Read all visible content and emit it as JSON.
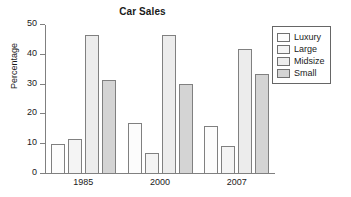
{
  "chart_data": {
    "type": "bar",
    "title": "Car Sales",
    "xlabel": "",
    "ylabel": "Percentage",
    "categories": [
      "1985",
      "2000",
      "2007"
    ],
    "series": [
      {
        "name": "Luxury",
        "values": [
          10.0,
          17.2,
          16.2
        ],
        "color": "#fcfcfc"
      },
      {
        "name": "Large",
        "values": [
          11.6,
          7.0,
          9.3
        ],
        "color": "#f4f4f4"
      },
      {
        "name": "Midsize",
        "values": [
          46.5,
          46.7,
          42.0
        ],
        "color": "#ececec"
      },
      {
        "name": "Small",
        "values": [
          31.6,
          30.2,
          33.4
        ],
        "color": "#d4d4d4"
      }
    ],
    "ylim": [
      0,
      50
    ],
    "yticks": [
      0,
      10,
      20,
      30,
      40,
      50
    ],
    "ytick_labels": [
      "0",
      "10",
      "20",
      "30",
      "40",
      "50"
    ],
    "grid": false,
    "legend_position": "upper right",
    "legend_entries": [
      "Luxury",
      "Large",
      "Midsize",
      "Small"
    ],
    "axis_color": "#808080",
    "text_color": "#1a1a1a",
    "background": "#ffffff"
  }
}
